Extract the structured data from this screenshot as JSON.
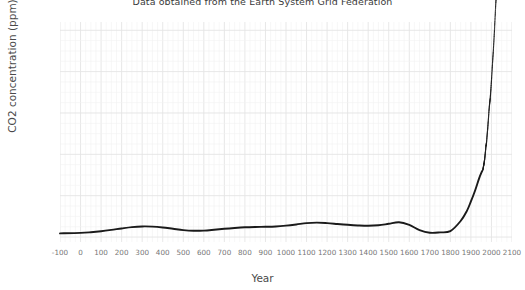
{
  "chart_data": {
    "type": "line",
    "title": "Data obtained from the Earth System Grid Federation",
    "xlabel": "Year",
    "ylabel": "CO2 concentration (ppm)",
    "xlim": [
      -100,
      2100
    ],
    "ylim": [
      272,
      405
    ],
    "grid": true,
    "legend": "none",
    "line_color": "#1a1a1a",
    "grid_color": "#e6e6e6",
    "background_color": "#ffffff",
    "xticks": [
      -100,
      0,
      100,
      200,
      300,
      400,
      500,
      600,
      700,
      800,
      900,
      1000,
      1100,
      1200,
      1300,
      1400,
      1500,
      1600,
      1700,
      1800,
      1900,
      2000,
      2100
    ],
    "yticks": [
      275,
      300,
      325,
      350,
      375,
      400
    ],
    "series": [
      {
        "name": "CO2 concentration",
        "style": "solid-line",
        "x": [
          -100,
          0,
          50,
          100,
          150,
          200,
          250,
          300,
          350,
          400,
          450,
          500,
          550,
          600,
          650,
          700,
          750,
          800,
          850,
          900,
          950,
          1000,
          1050,
          1100,
          1150,
          1200,
          1250,
          1300,
          1350,
          1400,
          1450,
          1500,
          1550,
          1600,
          1650,
          1700,
          1750,
          1800,
          1850,
          1880,
          1900,
          1920,
          1940,
          1955
        ],
        "y": [
          277.2,
          277.5,
          277.9,
          278.5,
          279.3,
          280.2,
          281.0,
          281.4,
          281.3,
          280.8,
          280.0,
          279.2,
          278.8,
          278.9,
          279.4,
          280.0,
          280.5,
          280.9,
          281.1,
          281.2,
          281.4,
          281.9,
          282.6,
          283.4,
          283.7,
          283.4,
          282.9,
          282.4,
          282.0,
          281.8,
          282.1,
          283.0,
          283.9,
          282.3,
          279.2,
          277.6,
          277.8,
          278.6,
          284.7,
          290.7,
          296.5,
          303.0,
          310.5,
          315.0
        ]
      },
      {
        "name": "CO2 concentration (recent, scattered)",
        "style": "dotted-scatter",
        "x": [
          1958,
          1961,
          1964,
          1967,
          1970,
          1973,
          1976,
          1979,
          1982,
          1985,
          1988,
          1991,
          1994,
          1997,
          2000,
          2003,
          2006,
          2009,
          2012,
          2015,
          2018,
          2021,
          2024,
          2027,
          2030
        ],
        "y": [
          315.5,
          317.6,
          319.6,
          322.2,
          325.7,
          329.7,
          332.1,
          336.8,
          341.1,
          346.0,
          351.5,
          355.6,
          358.8,
          363.8,
          369.5,
          375.8,
          381.9,
          387.4,
          393.8,
          400.8,
          408.5,
          416.0,
          422.0,
          428.0,
          434.0
        ]
      }
    ]
  }
}
